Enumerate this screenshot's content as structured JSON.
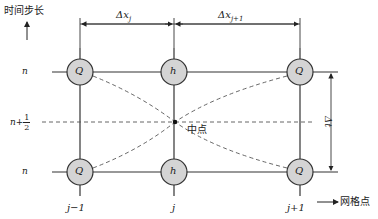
{
  "axes": {
    "time_axis_label": "时间步长",
    "grid_axis_label": "网格点"
  },
  "rows": {
    "top": "n",
    "middle_prefix": "n+",
    "middle_num": "1",
    "middle_den": "2",
    "bottom": "n"
  },
  "columns": {
    "left": "j−1",
    "middle": "j",
    "right": "j+1"
  },
  "dimensions": {
    "dx_left": "Δx",
    "dx_left_sub": "j",
    "dx_right": "Δx",
    "dx_right_sub": "j+1",
    "dt": "Δt"
  },
  "nodes": {
    "top_left": "Q",
    "top_middle": "h",
    "top_right": "Q",
    "bottom_left": "Q",
    "bottom_middle": "h",
    "bottom_right": "Q"
  },
  "midpoint_label": "中点",
  "colors": {
    "node_fill": "#d4d4d4",
    "line": "#333333",
    "dashed": "#555555"
  }
}
